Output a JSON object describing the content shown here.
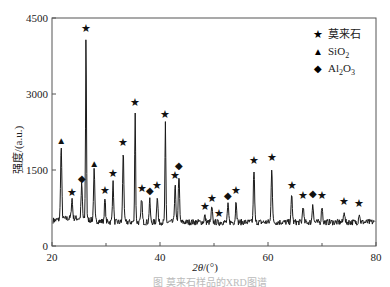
{
  "chart_data": {
    "type": "line",
    "title": "",
    "xlabel": "2θ/(°)",
    "ylabel": "强度/(a.u.)",
    "xlim": [
      20,
      80
    ],
    "ylim": [
      0,
      4500
    ],
    "x_ticks": [
      20,
      40,
      60,
      80
    ],
    "x_minor_ticks": [
      30,
      50,
      70
    ],
    "y_ticks": [
      0,
      1500,
      3000,
      4500
    ],
    "grid": false,
    "legend_position": "upper right",
    "legend": [
      {
        "marker": "star",
        "symbol": "★",
        "label": "莫来石"
      },
      {
        "marker": "triangle",
        "symbol": "▲",
        "label": "SiO",
        "sub": "2"
      },
      {
        "marker": "diamond",
        "symbol": "◆",
        "label": "Al",
        "sub": "2",
        "label2": "O",
        "sub2": "3"
      }
    ],
    "baseline": 470,
    "peaks": [
      {
        "x": 21.7,
        "y": 1900,
        "phase": "SiO2"
      },
      {
        "x": 23.7,
        "y": 860,
        "phase": "mullite"
      },
      {
        "x": 25.5,
        "y": 1150,
        "phase": "Al2O3"
      },
      {
        "x": 26.3,
        "y": 4100,
        "phase": "mullite"
      },
      {
        "x": 27.8,
        "y": 1450,
        "phase": "SiO2"
      },
      {
        "x": 29.8,
        "y": 900,
        "phase": "mullite"
      },
      {
        "x": 31.3,
        "y": 1250,
        "phase": "mullite"
      },
      {
        "x": 33.2,
        "y": 1850,
        "phase": "mullite"
      },
      {
        "x": 35.4,
        "y": 2650,
        "phase": "mullite"
      },
      {
        "x": 36.6,
        "y": 950,
        "phase": "mullite"
      },
      {
        "x": 38.1,
        "y": 900,
        "phase": "Al2O3"
      },
      {
        "x": 39.5,
        "y": 1000,
        "phase": "mullite"
      },
      {
        "x": 41.0,
        "y": 2400,
        "phase": "mullite"
      },
      {
        "x": 42.8,
        "y": 1200,
        "phase": "mullite"
      },
      {
        "x": 43.5,
        "y": 1400,
        "phase": "Al2O3"
      },
      {
        "x": 48.3,
        "y": 600,
        "phase": "mullite"
      },
      {
        "x": 49.6,
        "y": 750,
        "phase": "mullite"
      },
      {
        "x": 50.9,
        "y": 450,
        "phase": "mullite"
      },
      {
        "x": 52.6,
        "y": 800,
        "phase": "Al2O3"
      },
      {
        "x": 54.1,
        "y": 900,
        "phase": "mullite"
      },
      {
        "x": 57.4,
        "y": 1500,
        "phase": "mullite"
      },
      {
        "x": 60.7,
        "y": 1550,
        "phase": "mullite"
      },
      {
        "x": 64.4,
        "y": 1000,
        "phase": "mullite"
      },
      {
        "x": 66.5,
        "y": 800,
        "phase": "mullite"
      },
      {
        "x": 68.3,
        "y": 850,
        "phase": "Al2O3"
      },
      {
        "x": 70.0,
        "y": 800,
        "phase": "mullite"
      },
      {
        "x": 74.1,
        "y": 700,
        "phase": "mullite"
      },
      {
        "x": 76.9,
        "y": 650,
        "phase": "mullite"
      }
    ]
  },
  "labels": {
    "xlabel_main": "2θ",
    "xlabel_unit": "/(°)",
    "ylabel": "强度/(a.u.)",
    "legend_mullite": "莫来石",
    "legend_sio2": "SiO",
    "legend_sio2_sub": "2",
    "legend_al": "Al",
    "legend_al_sub": "2",
    "legend_o": "O",
    "legend_o_sub": "3",
    "caption": "图    莫来石样品的XRD图谱"
  },
  "colors": {
    "line": "#1a1a1a",
    "axis": "#555555",
    "marker": "#111111"
  }
}
